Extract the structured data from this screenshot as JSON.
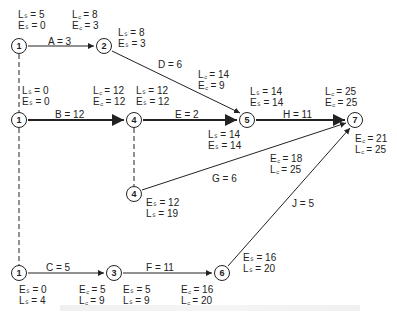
{
  "diagram": {
    "type": "activity-on-arrow network (PERT/CPM)",
    "nodes": [
      {
        "id": "n1a",
        "label": "1"
      },
      {
        "id": "n2",
        "label": "2"
      },
      {
        "id": "n1b",
        "label": "1"
      },
      {
        "id": "n4a",
        "label": "4"
      },
      {
        "id": "n5",
        "label": "5"
      },
      {
        "id": "n7",
        "label": "7"
      },
      {
        "id": "n4b",
        "label": "4"
      },
      {
        "id": "n1c",
        "label": "1"
      },
      {
        "id": "n3",
        "label": "3"
      },
      {
        "id": "n6",
        "label": "6"
      }
    ],
    "activities": [
      {
        "label": "A = 3"
      },
      {
        "label": "D = 6"
      },
      {
        "label": "B = 12"
      },
      {
        "label": "E = 2"
      },
      {
        "label": "H = 11"
      },
      {
        "label": "G = 6"
      },
      {
        "label": "J = 5"
      },
      {
        "label": "C = 5"
      },
      {
        "label": "F = 11"
      }
    ],
    "annotations": {
      "a_start_ls": "Lₛ = 5",
      "a_start_es": "Eₛ = 0",
      "a_end_lf": "L꜀ = 8",
      "a_end_ef": "E꜀ = 3",
      "d_start_ls": "Lₛ = 8",
      "d_start_es": "Eₛ = 3",
      "d_end_lf": "L꜀ = 14",
      "d_end_ef": "E꜀ = 9",
      "b_start_ls": "Lₛ = 0",
      "b_start_es": "Eₛ = 0",
      "b_end_lf": "L꜀ = 12",
      "b_end_ef": "E꜀ = 12",
      "e_start_ls": "Lₛ = 12",
      "e_start_es": "Eₛ = 12",
      "h_start_ls": "Lₛ = 14",
      "h_start_es": "Eₛ = 14",
      "h_end_lf": "L꜀ = 25",
      "h_end_ef": "E꜀ = 25",
      "e_end_ls": "Lₛ = 14",
      "e_end_es": "Eₛ = 14",
      "g_end_ef": "E꜀ = 18",
      "g_end_lf": "L꜀ = 25",
      "j_end_ef": "E꜀ = 21",
      "j_end_lf": "L꜀ = 25",
      "g_start_es": "Eₛ = 12",
      "g_start_ls": "Lₛ = 19",
      "j_start_es": "Eₛ = 16",
      "j_start_ls": "Lₛ = 20",
      "c_start_es": "Eₛ = 0",
      "c_start_ls": "Lₛ = 4",
      "c_end_ef": "E꜀ = 5",
      "c_end_lf": "L꜀ = 9",
      "f_start_es": "Eₛ = 5",
      "f_start_ls": "Lₛ = 9",
      "f_end_ef": "E꜀ = 16",
      "f_end_lf": "L꜀ = 20"
    }
  },
  "colors": {
    "line": "#222222",
    "background": "#ffffff"
  }
}
